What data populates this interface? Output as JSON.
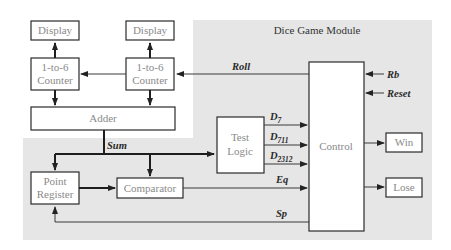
{
  "module": {
    "title": "Dice Game Module",
    "background": "#e6e6e6"
  },
  "blocks": {
    "display_1": "Display",
    "display_2": "Display",
    "counter_1": [
      "1-to-6",
      "Counter"
    ],
    "counter_2": [
      "1-to-6",
      "Counter"
    ],
    "adder": "Adder",
    "test_logic": [
      "Test",
      "Logic"
    ],
    "control": "Control",
    "point_register": [
      "Point",
      "Register"
    ],
    "comparator": "Comparator",
    "win": "Win",
    "lose": "Lose"
  },
  "signals": {
    "roll": "Roll",
    "rb": "Rb",
    "reset": "Reset",
    "sum": "Sum",
    "d7": {
      "base": "D",
      "sub": "7"
    },
    "d711": {
      "base": "D",
      "sub": "711"
    },
    "d2312": {
      "base": "D",
      "sub": "2312"
    },
    "eq": "Eq",
    "sp": "Sp"
  }
}
